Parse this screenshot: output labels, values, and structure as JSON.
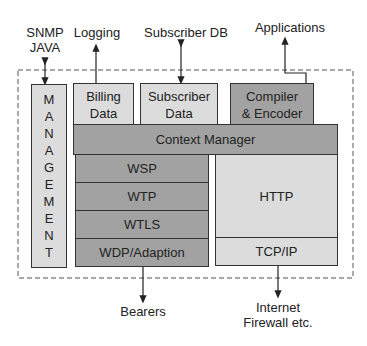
{
  "diagram": {
    "external_labels": {
      "snmp": "SNMP",
      "java": "JAVA",
      "logging": "Logging",
      "subscriber_db": "Subscriber DB",
      "applications": "Applications",
      "bearers": "Bearers",
      "internet": "Internet",
      "firewall": "Firewall etc."
    },
    "management_letters": [
      "M",
      "A",
      "N",
      "A",
      "G",
      "E",
      "M",
      "E",
      "N",
      "T"
    ],
    "boxes": {
      "billing_line1": "Billing",
      "billing_line2": "Data",
      "subscriber_line1": "Subscriber",
      "subscriber_line2": "Data",
      "compiler_line1": "Compiler",
      "compiler_line2": "& Encoder",
      "context_manager": "Context Manager",
      "wsp": "WSP",
      "wtp": "WTP",
      "wtls": "WTLS",
      "wdp": "WDP/Adaption",
      "http": "HTTP",
      "tcpip": "TCP/IP"
    },
    "colors": {
      "light_fill": "#dcdcdc",
      "medium_fill": "#b9b9b9",
      "dark_fill": "#a2a2a2",
      "stroke": "#333333"
    }
  }
}
